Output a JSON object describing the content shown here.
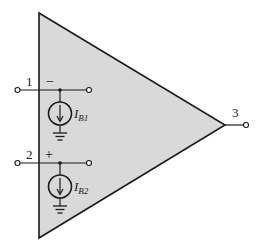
{
  "diagram": {
    "type": "op-amp input bias current model",
    "colors": {
      "body_fill": "#d9d9d9",
      "stroke": "#1a1a1a",
      "background": "#ffffff"
    },
    "terminals": [
      {
        "id": "1",
        "label": "1",
        "polarity": "−"
      },
      {
        "id": "2",
        "label": "2",
        "polarity": "+"
      },
      {
        "id": "3",
        "label": "3"
      }
    ],
    "sources": [
      {
        "name": "I",
        "subscript": "B1"
      },
      {
        "name": "I",
        "subscript": "B2"
      }
    ]
  }
}
